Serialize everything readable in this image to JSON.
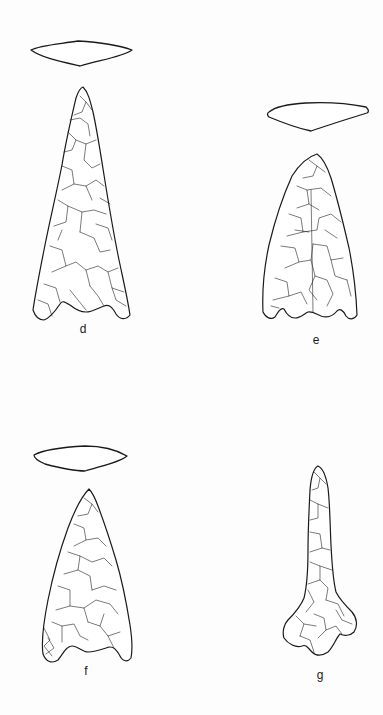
{
  "plate": {
    "figures": [
      {
        "id": "d",
        "label": "d",
        "description": "Triangular barbed projectile point with concave base and lenticular cross-section"
      },
      {
        "id": "e",
        "label": "e",
        "description": "Triangular projectile point with notched concave base and plano-convex cross-section"
      },
      {
        "id": "f",
        "label": "f",
        "description": "Triangular barbed projectile point with concave base and lenticular cross-section"
      },
      {
        "id": "g",
        "label": "g",
        "description": "Narrow elongated drill/point with expanded base"
      }
    ]
  },
  "colors": {
    "background": "#ffffff",
    "line": "#1a1a1a"
  }
}
